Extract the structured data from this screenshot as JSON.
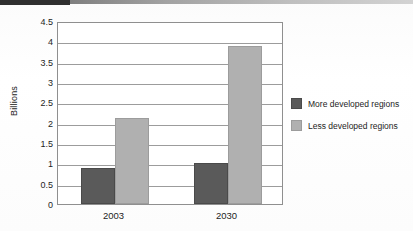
{
  "chart_data": {
    "type": "bar",
    "title": "",
    "xlabel": "",
    "ylabel": "Billions",
    "categories": [
      "2003",
      "2030"
    ],
    "series": [
      {
        "name": "More developed regions",
        "color": "#5a5a5a",
        "values": [
          0.88,
          1.0
        ]
      },
      {
        "name": "Less developed regions",
        "color": "#b0b0b0",
        "values": [
          2.12,
          3.88
        ]
      }
    ],
    "ylim": [
      0,
      4.5
    ],
    "ytick_labels": [
      "4.5",
      "4",
      "3.5",
      "3",
      "2.5",
      "2",
      "1.5",
      "1",
      "0.5",
      "0"
    ],
    "ytick_values": [
      4.5,
      4,
      3.5,
      3,
      2.5,
      2,
      1.5,
      1,
      0.5,
      0
    ],
    "grid": true,
    "legend_position": "right"
  },
  "legend": {
    "items": [
      {
        "label": "More developed regions",
        "swatch": "dark"
      },
      {
        "label": "Less developed regions",
        "swatch": "light"
      }
    ]
  }
}
